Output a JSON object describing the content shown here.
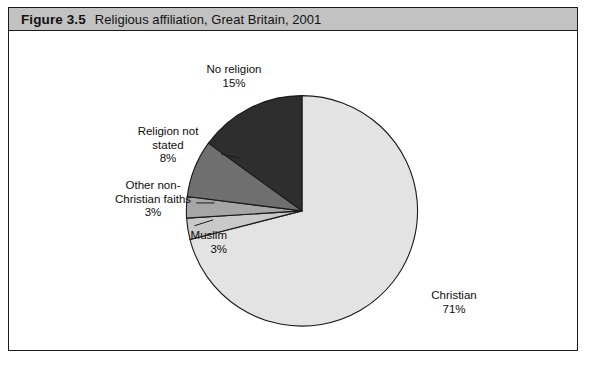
{
  "figure": {
    "number": "Figure 3.5",
    "title": "Religious affiliation, Great Britain, 2001"
  },
  "chart_data": {
    "type": "pie",
    "title": "Religious affiliation, Great Britain, 2001",
    "xlabel": "",
    "ylabel": "",
    "value_unit": "%",
    "start_angle_deg": 0,
    "direction": "clockwise",
    "legend": "none (direct labels with leader lines)",
    "grid": false,
    "categories": [
      "Christian",
      "Muslim",
      "Other non-Christian faiths",
      "Religion not stated",
      "No religion"
    ],
    "values": [
      71,
      3,
      3,
      8,
      15
    ],
    "slices": [
      {
        "label": "Christian",
        "value": 71,
        "value_text": "71%",
        "color": "#e3e3e3",
        "label_lines": [
          "Christian",
          "71%"
        ]
      },
      {
        "label": "Muslim",
        "value": 3,
        "value_text": "3%",
        "color": "#c9c9c9",
        "label_lines": [
          "Muslim",
          "3%"
        ]
      },
      {
        "label": "Other non-Christian faiths",
        "value": 3,
        "value_text": "3%",
        "color": "#a6a6a6",
        "label_lines": [
          "Other non-",
          "Christian faiths",
          "3%"
        ]
      },
      {
        "label": "Religion not stated",
        "value": 8,
        "value_text": "8%",
        "color": "#6f6f6f",
        "label_lines": [
          "Religion not",
          "stated",
          "8%"
        ]
      },
      {
        "label": "No religion",
        "value": 15,
        "value_text": "15%",
        "color": "#2e2e2e",
        "label_lines": [
          "No religion",
          "15%"
        ]
      }
    ]
  },
  "labels": {
    "no_religion": {
      "line1": "No religion",
      "line2": "15%"
    },
    "religion_not_stated": {
      "line1": "Religion not",
      "line2": "stated",
      "line3": "8%"
    },
    "other_faiths": {
      "line1": "Other non-",
      "line2": "Christian faiths",
      "line3": "3%"
    },
    "muslim": {
      "line1": "Muslim",
      "line2": "3%"
    },
    "christian": {
      "line1": "Christian",
      "line2": "71%"
    }
  },
  "colors": {
    "frame_border": "#1a1a1a",
    "header_band": "#c2c2c2",
    "background": "#ffffff",
    "text": "#0d0d0d"
  }
}
